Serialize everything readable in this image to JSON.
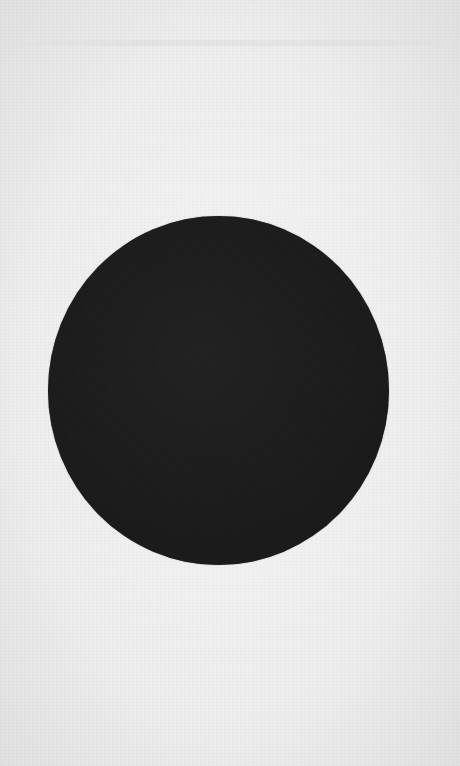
{
  "scene": {
    "background": {
      "description": "textured light paper",
      "color": "#eeeeee"
    },
    "shape": {
      "type": "circle",
      "color": "#1a1a1a",
      "center": [
        218,
        390
      ],
      "width": 341,
      "height": 349
    }
  }
}
